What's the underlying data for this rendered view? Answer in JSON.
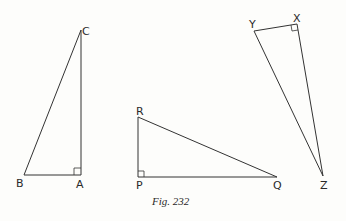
{
  "figure": {
    "caption": "Fig. 232",
    "triangles": [
      {
        "name": "ABC",
        "right_angle_at": "A",
        "vertices": {
          "A": {
            "label": "A",
            "x": 81,
            "y": 175
          },
          "B": {
            "label": "B",
            "x": 24,
            "y": 175
          },
          "C": {
            "label": "C",
            "x": 81,
            "y": 30
          }
        }
      },
      {
        "name": "PQR",
        "right_angle_at": "P",
        "vertices": {
          "P": {
            "label": "P",
            "x": 138,
            "y": 177
          },
          "Q": {
            "label": "Q",
            "x": 277,
            "y": 177
          },
          "R": {
            "label": "R",
            "x": 138,
            "y": 117
          }
        }
      },
      {
        "name": "XYZ",
        "right_angle_at": "X",
        "vertices": {
          "X": {
            "label": "X",
            "x": 297,
            "y": 24
          },
          "Y": {
            "label": "Y",
            "x": 254,
            "y": 31
          },
          "Z": {
            "label": "Z",
            "x": 323,
            "y": 176
          }
        }
      }
    ]
  },
  "colors": {
    "line": "#333333",
    "background": "#fdfdfb"
  }
}
